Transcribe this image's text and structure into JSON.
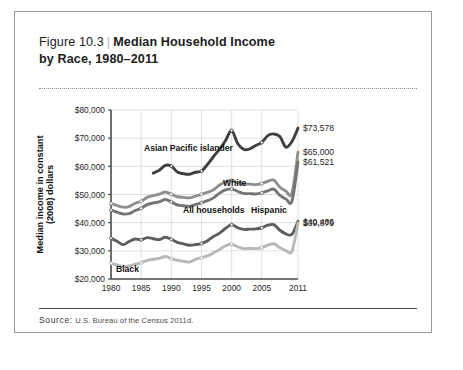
{
  "figure": {
    "number": "Figure 10.3",
    "separator": "|",
    "title_line1": "Median Household Income",
    "title_line2": "by Race, 1980–2011",
    "source_label": "Source:",
    "source_text": "U.S. Bureau of the Census 2011d."
  },
  "chart_data": {
    "type": "line",
    "title": "Median Household Income by Race, 1980–2011",
    "xlabel": "",
    "ylabel": "Median income in constant (2008) dollars",
    "xlim": [
      1980,
      2011
    ],
    "ylim": [
      20000,
      80000
    ],
    "yticks": [
      20000,
      30000,
      40000,
      50000,
      60000,
      70000,
      80000
    ],
    "ytick_labels": [
      "$20,000",
      "$30,000",
      "$40,000",
      "$50,000",
      "$60,000",
      "$70,000",
      "$80,000"
    ],
    "xticks": [
      1980,
      1985,
      1990,
      1995,
      2000,
      2005,
      2011
    ],
    "xtick_labels": [
      "1980",
      "1985",
      "1990",
      "1995",
      "2000",
      "2005",
      "2011"
    ],
    "grid": "horizontal-and-vertical",
    "legend": "inline-labels",
    "x": [
      1980,
      1981,
      1982,
      1983,
      1984,
      1985,
      1986,
      1987,
      1988,
      1989,
      1990,
      1991,
      1992,
      1993,
      1994,
      1995,
      1996,
      1997,
      1998,
      1999,
      2000,
      2001,
      2002,
      2003,
      2004,
      2005,
      2006,
      2007,
      2008,
      2009,
      2010,
      2011
    ],
    "series": [
      {
        "name": "Asian Pacific islander",
        "color": "#3f3f3f",
        "label": "Asian Pacific islander",
        "end_value": 73578,
        "end_label": "$73,578",
        "start_year": 1987,
        "values": [
          null,
          null,
          null,
          null,
          null,
          null,
          null,
          57600,
          58600,
          60300,
          60100,
          58000,
          57400,
          57200,
          57900,
          58300,
          60700,
          63500,
          66100,
          69200,
          72700,
          68100,
          66000,
          66200,
          67400,
          68500,
          70900,
          71500,
          70600,
          66800,
          68800,
          73578
        ]
      },
      {
        "name": "White",
        "color": "#8f8f8f",
        "label": "White",
        "end_value": 65000,
        "end_label": "$65,000",
        "start_year": 1980,
        "values": [
          46800,
          46100,
          45500,
          45700,
          46900,
          47600,
          49000,
          49600,
          50100,
          50900,
          50100,
          49200,
          49000,
          48800,
          49400,
          50100,
          50800,
          51700,
          53400,
          54500,
          55100,
          54200,
          53700,
          53700,
          53500,
          53900,
          54700,
          55100,
          52600,
          51200,
          50500,
          65000
        ]
      },
      {
        "name": "All households",
        "color": "#757575",
        "label": "All households",
        "end_value": 61521,
        "end_label": "$61,521",
        "start_year": 1980,
        "values": [
          44500,
          43700,
          43100,
          43200,
          44300,
          45100,
          46400,
          47000,
          47400,
          48200,
          47400,
          46300,
          46000,
          45800,
          46400,
          47100,
          47800,
          48800,
          50500,
          51600,
          52000,
          51100,
          50400,
          50300,
          50200,
          50600,
          51300,
          51900,
          49700,
          48400,
          47700,
          61521
        ]
      },
      {
        "name": "Hispanic",
        "color": "#5d5d5d",
        "label": "Hispanic",
        "end_value": 40466,
        "end_label": "$40,466",
        "start_year": 1980,
        "values": [
          34500,
          33400,
          32200,
          33300,
          34200,
          33900,
          34700,
          34300,
          34000,
          34800,
          34100,
          33000,
          32500,
          32000,
          32200,
          32600,
          33600,
          35100,
          36300,
          38000,
          39300,
          38200,
          37600,
          37700,
          37800,
          38200,
          39100,
          39300,
          37300,
          36000,
          35900,
          40466
        ]
      },
      {
        "name": "Black",
        "color": "#b8b8b8",
        "label": "Black",
        "end_value": 39879,
        "end_label": "$39,879",
        "start_year": 1980,
        "values": [
          25600,
          25000,
          24400,
          24600,
          25200,
          25800,
          26600,
          27000,
          27300,
          28000,
          27200,
          26600,
          26300,
          26000,
          27000,
          27600,
          28200,
          29300,
          30500,
          31800,
          32400,
          31400,
          30800,
          30900,
          30800,
          31100,
          32000,
          32500,
          31100,
          30100,
          29900,
          39879
        ]
      }
    ]
  }
}
